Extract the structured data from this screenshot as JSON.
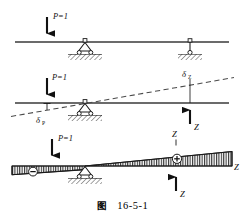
{
  "figure": {
    "caption_label": "图",
    "caption_number": "16-5-1",
    "background_color": "#ffffff",
    "ink_color": "#1a1a1a",
    "hatch_color": "#2b2b2b"
  },
  "panels": [
    {
      "id": "panel-top",
      "name": "original-structure",
      "description": "Beam with unit load P=1 on an overhanging beam with pin support and link support",
      "beam": {
        "x1": 15,
        "y": 42,
        "x2": 229
      },
      "load": {
        "label": "P=1",
        "x": 47,
        "arrow_top": 17,
        "arrow_bottom": 41
      },
      "supports": [
        {
          "type": "pin-roller",
          "x": 85,
          "y": 42
        },
        {
          "type": "link-hanger",
          "x": 190,
          "y": 42
        }
      ]
    },
    {
      "id": "panel-middle",
      "name": "released-structure",
      "description": "Released primary system: unit load P=1 produces displacement delta-P and redundant Z produces delta-Z",
      "beam": {
        "x1": 15,
        "y": 103,
        "x2": 229
      },
      "load": {
        "label": "P=1",
        "x": 47,
        "arrow_top": 78,
        "arrow_bottom": 102
      },
      "supports": [
        {
          "type": "pin-roller",
          "x": 85,
          "y": 103
        }
      ],
      "deflection_line": {
        "x1": 12,
        "y1": 116,
        "x2": 234,
        "y2": 78,
        "style": "dashed"
      },
      "labels": [
        {
          "text": "δ",
          "sub": "P",
          "x": 38,
          "y": 120
        },
        {
          "text": "δ",
          "sub": "Z",
          "x": 184,
          "y": 76
        },
        {
          "text": "Z",
          "sub": "",
          "x": 196,
          "y": 129
        }
      ],
      "reaction": {
        "label": "Z",
        "x": 190,
        "arrow_bottom": 124,
        "arrow_top": 101,
        "direction": "up"
      },
      "tick_marks": [
        {
          "x": 190,
          "y1": 78,
          "y2": 103
        }
      ]
    },
    {
      "id": "panel-bottom",
      "name": "influence-line",
      "description": "Influence line diagram for Z with negative ordinate left of support and positive ordinate right of support",
      "baseline": {
        "x1": 12,
        "y": 166,
        "x2": 232
      },
      "load": {
        "label": "P=1",
        "x": 52,
        "arrow_top": 138,
        "arrow_bottom": 163
      },
      "supports": [
        {
          "type": "pin-roller",
          "x": 85,
          "y": 166
        }
      ],
      "zero_point_x": 85,
      "left_lobe": {
        "x_start": 12,
        "x_end": 85,
        "max_offset": 9,
        "sign": "−",
        "sign_x": 33,
        "sign_y": 172
      },
      "right_lobe": {
        "x_start": 85,
        "x_end": 232,
        "max_offset": 19,
        "sign": "+",
        "sign_x": 177,
        "sign_y": 160
      },
      "reaction": {
        "label": "Z",
        "x": 176,
        "arrow_bottom": 191,
        "arrow_top": 170,
        "direction": "up"
      },
      "labels": [
        {
          "text": "Z",
          "x": 176,
          "y": 137,
          "name": "z-top-label"
        },
        {
          "text": "Z",
          "x": 236,
          "y": 170,
          "name": "z-right-label"
        },
        {
          "text": "Z",
          "x": 182,
          "y": 196,
          "name": "z-bottom-label"
        }
      ]
    }
  ],
  "symbols": {
    "unit_load": "P=1",
    "delta": "δ",
    "redundant": "Z",
    "negative_sign": "−",
    "positive_sign": "+"
  }
}
